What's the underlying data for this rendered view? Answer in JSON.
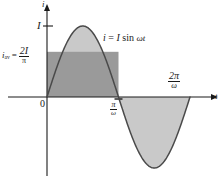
{
  "chart_data": {
    "type": "line",
    "title": "",
    "equation": "i = I sin ωt",
    "xlabel": "t",
    "ylabel": "i",
    "x": [
      0,
      0.0654,
      0.1309,
      0.1963,
      0.2618,
      0.3272,
      0.3927,
      0.4581,
      0.5236,
      0.589,
      0.6545,
      0.7199,
      0.7854,
      0.8508,
      0.9163,
      0.9817,
      1.0472,
      1.1126,
      1.1781,
      1.2435,
      1.309,
      1.3744,
      1.4399,
      1.5053,
      1.5708,
      1.6362,
      1.7017,
      1.7671,
      1.8326,
      1.898,
      1.9635,
      2.0289,
      2.0944,
      2.1598,
      2.2253,
      2.2907,
      2.3562,
      2.4217,
      2.4871,
      2.5525,
      2.618,
      2.6834,
      2.7489,
      2.8143,
      2.8798,
      2.9452,
      3.0107,
      3.0761,
      3.1416,
      3.207,
      3.2725,
      3.3379,
      3.4034,
      3.4688,
      3.5343,
      3.5997,
      3.6652,
      3.7306,
      3.7961,
      3.8615,
      3.927,
      3.9924,
      4.0579,
      4.1233,
      4.1888,
      4.2542,
      4.3197,
      4.3851,
      4.4506,
      4.516,
      4.5815,
      4.6469,
      4.7124,
      4.7779,
      4.8433,
      4.9087,
      4.9742,
      5.0396,
      5.1051,
      5.1705,
      5.236,
      5.3014,
      5.3669,
      5.4323,
      5.4978,
      5.5632,
      5.6287,
      5.6941,
      5.7596,
      5.825,
      5.8905,
      5.9559,
      6.0214,
      6.0868,
      6.1523,
      6.2177,
      6.2832
    ],
    "y_formula": "sin(x)",
    "amplitude_label": "I",
    "amplitude_value": 1,
    "average_label": "i_av",
    "average_expression": "2I/π",
    "average_value": 0.6366,
    "xticks": [
      {
        "x": 0,
        "label": "0"
      },
      {
        "x": 3.1416,
        "label": "π/ω"
      },
      {
        "x": 6.2832,
        "label": "2π/ω"
      }
    ],
    "yticks": [
      {
        "y": 1,
        "label": "I"
      }
    ],
    "xlim": [
      -0.45,
      7.0
    ],
    "ylim": [
      -1.35,
      1.45
    ],
    "grid": false,
    "legend": false,
    "series": [
      {
        "name": "i = I sin ωt",
        "type": "sine",
        "stroke": "#4a4a4a",
        "fill_positive": "#c9c9c9",
        "fill_negative": "#c9c9c9"
      },
      {
        "name": "i_av = 2I/π rectangle",
        "type": "rect",
        "x_range": [
          0,
          3.1416
        ],
        "y_range": [
          0,
          0.6366
        ],
        "fill": "#9a9a9a"
      }
    ]
  },
  "labels": {
    "y_axis": "i",
    "x_axis": "t",
    "origin": "0",
    "amplitude": "I",
    "equation_i": "i",
    "equation_equals": "=",
    "equation_I": "I",
    "equation_sin": "sin",
    "equation_omega_t": "ωt",
    "iav_symbol": "i",
    "iav_subscript": "av",
    "iav_equals": "=",
    "iav_numerator": "2I",
    "iav_denominator": "π",
    "pi_over_omega_num": "π",
    "pi_over_omega_den": "ω",
    "two_pi_over_omega_num": "2π",
    "two_pi_over_omega_den": "ω"
  },
  "colors": {
    "background": "#ffffff",
    "axis": "#1a1a1a",
    "curve": "#4a4a4a",
    "fill_light": "#c9c9c9",
    "fill_dark": "#9a9a9a",
    "text": "#1a1a1a"
  }
}
